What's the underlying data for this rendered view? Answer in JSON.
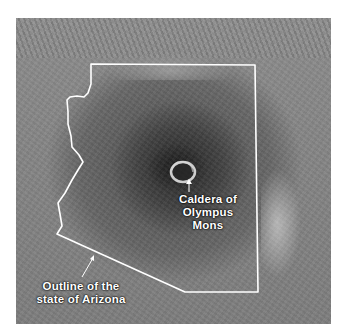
{
  "image": {
    "subject": "Olympus Mons with outline of Arizona overlaid",
    "labels": {
      "caldera_line1": "Caldera of",
      "caldera_line2": "Olympus Mons",
      "arizona_line1": "Outline of the",
      "arizona_line2": "state of Arizona"
    },
    "colors": {
      "outline": "#ffffff",
      "label_text": "#ffffff",
      "background": "#ffffff"
    }
  }
}
